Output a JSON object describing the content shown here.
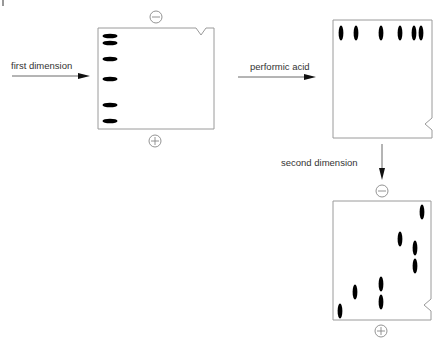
{
  "labels": {
    "first_dimension": "first dimension",
    "performic_acid": "performic acid",
    "second_dimension": "second dimension"
  },
  "colors": {
    "box_stroke": "#9a9a9a",
    "band_fill": "#000000",
    "text": "#333333",
    "arrow": "#222222"
  },
  "gels": [
    {
      "name": "first-dimension-gel",
      "box": {
        "x": 98,
        "y": 28,
        "w": 116,
        "h": 101
      },
      "notch": {
        "side": "top",
        "pos": 201
      },
      "minus_electrode": {
        "cx": 156,
        "cy": 17
      },
      "plus_electrode": {
        "cx": 155,
        "cy": 141
      },
      "bands_orientation": "horizontal",
      "bands": [
        {
          "cx": 110,
          "cy": 36
        },
        {
          "cx": 110,
          "cy": 43
        },
        {
          "cx": 110,
          "cy": 59
        },
        {
          "cx": 110,
          "cy": 79
        },
        {
          "cx": 110,
          "cy": 105
        },
        {
          "cx": 110,
          "cy": 121
        }
      ]
    },
    {
      "name": "oxidized-gel",
      "box": {
        "x": 333,
        "y": 20,
        "w": 99,
        "h": 118
      },
      "notch": {
        "side": "right",
        "pos": 124
      },
      "bands_orientation": "vertical",
      "bands": [
        {
          "cx": 341,
          "cy": 33
        },
        {
          "cx": 356,
          "cy": 33
        },
        {
          "cx": 381,
          "cy": 33
        },
        {
          "cx": 400,
          "cy": 33
        },
        {
          "cx": 414,
          "cy": 33
        },
        {
          "cx": 421,
          "cy": 33
        }
      ]
    },
    {
      "name": "second-dimension-gel",
      "box": {
        "x": 333,
        "y": 201,
        "w": 98,
        "h": 119
      },
      "notch": {
        "side": "right",
        "pos": 305
      },
      "minus_electrode": {
        "cx": 382,
        "cy": 191
      },
      "plus_electrode": {
        "cx": 381,
        "cy": 331
      },
      "bands_orientation": "vertical",
      "bands": [
        {
          "cx": 422,
          "cy": 212
        },
        {
          "cx": 400,
          "cy": 239
        },
        {
          "cx": 415,
          "cy": 248
        },
        {
          "cx": 415,
          "cy": 266
        },
        {
          "cx": 381,
          "cy": 284
        },
        {
          "cx": 381,
          "cy": 302
        },
        {
          "cx": 355,
          "cy": 292
        },
        {
          "cx": 340,
          "cy": 311
        }
      ]
    }
  ],
  "arrows": [
    {
      "name": "first-dimension-arrow",
      "x1": 12,
      "y1": 76,
      "x2": 89,
      "y2": 76
    },
    {
      "name": "performic-acid-arrow",
      "x1": 238,
      "y1": 77,
      "x2": 315,
      "y2": 77
    },
    {
      "name": "second-dimension-arrow",
      "x1": 382,
      "y1": 144,
      "x2": 382,
      "y2": 179
    }
  ]
}
